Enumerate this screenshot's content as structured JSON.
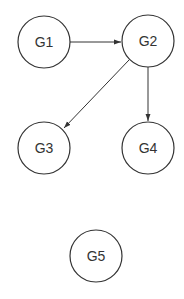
{
  "diagram": {
    "type": "directed-graph",
    "nodes": [
      {
        "id": "G1",
        "label": "G1",
        "cx": 44,
        "cy": 42,
        "r": 26
      },
      {
        "id": "G2",
        "label": "G2",
        "cx": 148,
        "cy": 41,
        "r": 26
      },
      {
        "id": "G3",
        "label": "G3",
        "cx": 44,
        "cy": 148,
        "r": 26
      },
      {
        "id": "G4",
        "label": "G4",
        "cx": 148,
        "cy": 148,
        "r": 26
      },
      {
        "id": "G5",
        "label": "G5",
        "cx": 96,
        "cy": 256,
        "r": 26
      }
    ],
    "edges": [
      {
        "from": "G1",
        "to": "G2"
      },
      {
        "from": "G2",
        "to": "G3"
      },
      {
        "from": "G2",
        "to": "G4"
      }
    ]
  },
  "colors": {
    "stroke": "#333333",
    "background": "#ffffff"
  }
}
